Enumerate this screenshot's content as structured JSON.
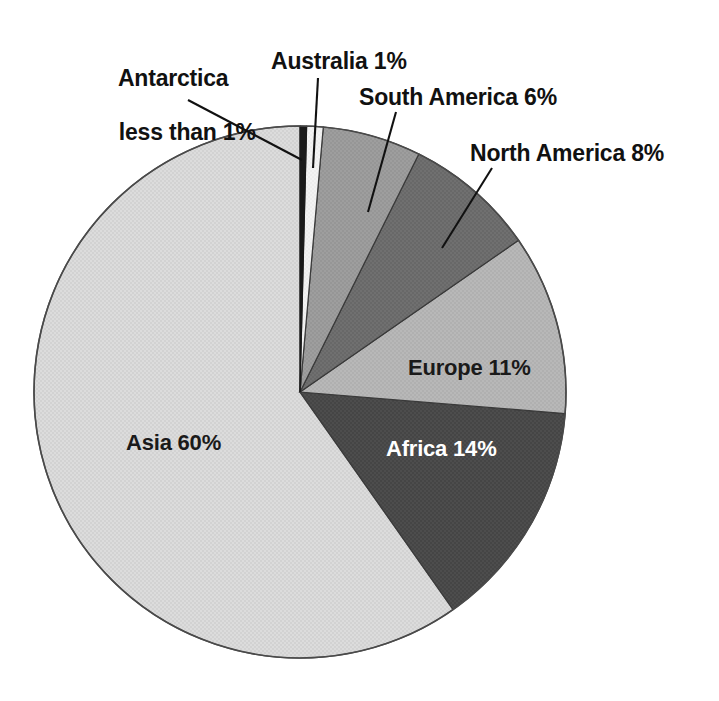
{
  "chart_data": {
    "type": "pie",
    "title": "",
    "subtitle": "",
    "xlabel": "",
    "ylabel": "",
    "legend_position": "none",
    "grid": false,
    "units": "percent of world population",
    "start_angle_deg": 0,
    "direction": "clockwise",
    "categories": [
      "Antarctica",
      "Australia",
      "South America",
      "North America",
      "Europe",
      "Africa",
      "Asia"
    ],
    "values": [
      0.4,
      1,
      6,
      8,
      11,
      14,
      60
    ],
    "labels": [
      "Antarctica less than 1%",
      "Australia 1%",
      "South America 6%",
      "North America 8%",
      "Europe 11%",
      "Africa 14%",
      "Asia 60%"
    ],
    "slice_colors": [
      "#1a1a1a",
      "#f2f2f2",
      "#9c9c9c",
      "#6e6e6e",
      "#b6b6b6",
      "#4b4b4b",
      "#dadada"
    ]
  },
  "slices": [
    {
      "name": "antarctica",
      "label": "Antarctica",
      "value_text": "less than 1%",
      "value": 0.4,
      "color": "#1a1a1a",
      "label_placement": "callout"
    },
    {
      "name": "australia",
      "label": "Australia 1%",
      "value": 1,
      "color": "#f2f2f2",
      "label_placement": "callout"
    },
    {
      "name": "south-america",
      "label": "South America 6%",
      "value": 6,
      "color": "#9c9c9c",
      "label_placement": "callout"
    },
    {
      "name": "north-america",
      "label": "North America 8%",
      "value": 8,
      "color": "#6e6e6e",
      "label_placement": "callout"
    },
    {
      "name": "europe",
      "label": "Europe 11%",
      "value": 11,
      "color": "#b6b6b6",
      "label_placement": "inside"
    },
    {
      "name": "africa",
      "label": "Africa 14%",
      "value": 14,
      "color": "#4b4b4b",
      "label_placement": "inside"
    },
    {
      "name": "asia",
      "label": "Asia 60%",
      "value": 60,
      "color": "#dadada",
      "label_placement": "inside"
    }
  ],
  "callouts": {
    "antarctica_line1": "Antarctica",
    "antarctica_line2": "less than 1%",
    "australia": "Australia 1%",
    "south_america": "South America 6%",
    "north_america": "North America 8%"
  },
  "inner_labels": {
    "europe": "Europe 11%",
    "africa": "Africa 14%",
    "asia": "Asia 60%"
  },
  "style": {
    "background": "#ffffff",
    "outline": "#3a3a3a",
    "leader_line": "#1a1a1a",
    "text_dark": "#1a1a1a",
    "text_light": "#ffffff"
  }
}
